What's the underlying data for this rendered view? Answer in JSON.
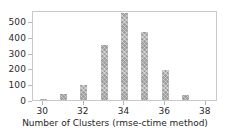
{
  "chart_data": {
    "type": "bar",
    "title": "",
    "xlabel": "Number of Clusters (rmse-ctime method)",
    "ylabel": "",
    "categories": [
      30,
      31,
      32,
      33,
      34,
      35,
      36,
      37
    ],
    "values": [
      5,
      38,
      98,
      350,
      550,
      430,
      192,
      30
    ],
    "series": [
      {
        "name": "Count",
        "values": [
          5,
          38,
          98,
          350,
          550,
          430,
          192,
          30
        ]
      }
    ],
    "xlim": [
      29.5,
      38.6
    ],
    "ylim": [
      0,
      570
    ],
    "xticks": [
      30,
      32,
      34,
      36,
      38
    ],
    "xtick_labels": [
      "30",
      "32",
      "34",
      "36",
      "38"
    ],
    "yticks": [
      0,
      100,
      200,
      300,
      400,
      500
    ],
    "ytick_labels": [
      "0",
      "100",
      "200",
      "300",
      "400",
      "500"
    ],
    "grid": false,
    "legend": false,
    "legend_position": "none",
    "bar_width": 0.35,
    "bar_color": "#9e9e9e",
    "bar_hatch": "crosshatch",
    "axes_color": "#c9c9c9",
    "text_color": "#2b2b2b",
    "background": "#ffffff"
  }
}
